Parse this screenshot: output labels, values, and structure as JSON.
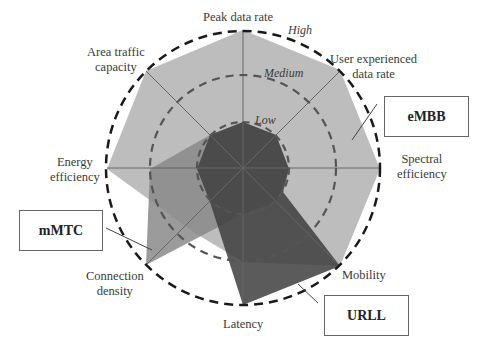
{
  "axes": [
    {
      "id": "peak",
      "label": "Peak data rate"
    },
    {
      "id": "user",
      "label": "User experienced data rate"
    },
    {
      "id": "spectral",
      "label": "Spectral efficiency"
    },
    {
      "id": "mobility",
      "label": "Mobility"
    },
    {
      "id": "latency",
      "label": "Latency"
    },
    {
      "id": "connection",
      "label": "Connection density"
    },
    {
      "id": "energy",
      "label": "Energy efficiency"
    },
    {
      "id": "area",
      "label": "Area traffic capacity"
    }
  ],
  "labels": {
    "peak": "Peak data rate",
    "user_line1": "User experienced",
    "user_line2": "data rate",
    "spectral_line1": "Spectral",
    "spectral_line2": "efficiency",
    "mobility": "Mobility",
    "latency": "Latency",
    "connection_line1": "Connection",
    "connection_line2": "density",
    "energy_line1": "Energy",
    "energy_line2": "efficiency",
    "area_line1": "Area traffic",
    "area_line2": "capacity"
  },
  "levels": {
    "high": "High",
    "medium": "Medium",
    "low": "Low"
  },
  "scenarios": {
    "embb": "eMBB",
    "mmtc": "mMTC",
    "urll": "URLL"
  },
  "colors": {
    "embb_fill": "#bdbdbd",
    "mmtc_fill": "#8f8f8f",
    "urll_fill": "#4a4a4a",
    "dash_outer": "#1a1a1a",
    "dash_inner": "#555555",
    "axis": "#666666"
  }
}
